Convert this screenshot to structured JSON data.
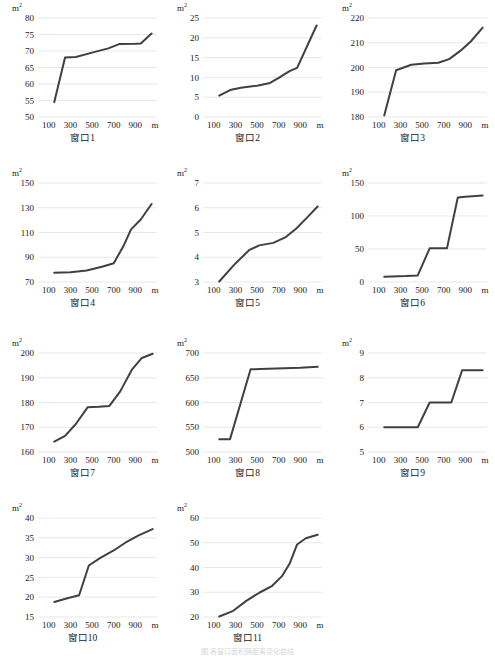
{
  "page": {
    "unit_label": "m",
    "unit_superscript": "2",
    "x_unit": "m",
    "footer_note": "图  各窗口面积随距离变化曲线"
  },
  "charts": [
    {
      "id": "chart-1",
      "caption": "窗口1",
      "chart_data": {
        "type": "line",
        "title": "窗口1",
        "xlabel": "m",
        "ylabel": "m²",
        "xlim": [
          0,
          1100
        ],
        "ylim": [
          50,
          80
        ],
        "yticks": [
          50,
          55,
          60,
          65,
          70,
          75,
          80
        ],
        "xticks": [
          100,
          300,
          500,
          700,
          900
        ],
        "grid": true,
        "legend": "none",
        "x": [
          150,
          250,
          350,
          500,
          650,
          750,
          900,
          950,
          1050
        ],
        "y": [
          54.5,
          68.0,
          68.2,
          69.5,
          70.8,
          72.1,
          72.2,
          72.3,
          75.3
        ]
      }
    },
    {
      "id": "chart-2",
      "caption": "窗口2",
      "chart_data": {
        "type": "line",
        "title": "窗口2",
        "xlabel": "m",
        "ylabel": "m²",
        "xlim": [
          0,
          1100
        ],
        "ylim": [
          0,
          25
        ],
        "yticks": [
          0,
          5,
          10,
          15,
          20,
          25
        ],
        "xticks": [
          100,
          300,
          500,
          700,
          900
        ],
        "grid": true,
        "legend": "none",
        "x": [
          150,
          250,
          350,
          500,
          620,
          700,
          800,
          870,
          1050
        ],
        "y": [
          5.4,
          6.8,
          7.4,
          7.9,
          8.6,
          9.9,
          11.6,
          12.4,
          23.1
        ]
      }
    },
    {
      "id": "chart-3",
      "caption": "窗口3",
      "chart_data": {
        "type": "line",
        "title": "窗口3",
        "xlabel": "m",
        "ylabel": "m²",
        "xlim": [
          0,
          1100
        ],
        "ylim": [
          180,
          220
        ],
        "yticks": [
          180,
          190,
          200,
          210,
          220
        ],
        "xticks": [
          100,
          300,
          500,
          700,
          900
        ],
        "grid": true,
        "legend": "none",
        "x": [
          150,
          260,
          400,
          520,
          650,
          750,
          850,
          950,
          1060
        ],
        "y": [
          180.6,
          198.9,
          201.1,
          201.6,
          201.9,
          203.4,
          206.6,
          210.5,
          216.1
        ]
      }
    },
    {
      "id": "chart-4",
      "caption": "窗口4",
      "chart_data": {
        "type": "line",
        "title": "窗口4",
        "xlabel": "m",
        "ylabel": "m²",
        "xlim": [
          0,
          1100
        ],
        "ylim": [
          70,
          150
        ],
        "yticks": [
          70,
          90,
          110,
          130,
          150
        ],
        "xticks": [
          100,
          300,
          500,
          700,
          900
        ],
        "grid": true,
        "legend": "none",
        "x": [
          150,
          300,
          450,
          600,
          700,
          790,
          860,
          950,
          1050
        ],
        "y": [
          77.5,
          77.8,
          79.3,
          82.5,
          85.2,
          99.0,
          112.5,
          120.5,
          133.0
        ]
      }
    },
    {
      "id": "chart-5",
      "caption": "窗口5",
      "chart_data": {
        "type": "line",
        "title": "窗口5",
        "xlabel": "m",
        "ylabel": "m²",
        "xlim": [
          0,
          1100
        ],
        "ylim": [
          3,
          7
        ],
        "yticks": [
          3,
          4,
          5,
          6,
          7
        ],
        "xticks": [
          100,
          300,
          500,
          700,
          900
        ],
        "grid": true,
        "legend": "none",
        "x": [
          150,
          300,
          430,
          520,
          650,
          760,
          860,
          950,
          1060
        ],
        "y": [
          3.02,
          3.75,
          4.3,
          4.48,
          4.58,
          4.8,
          5.15,
          5.55,
          6.05
        ]
      }
    },
    {
      "id": "chart-6",
      "caption": "窗口6",
      "chart_data": {
        "type": "line",
        "title": "窗口6",
        "xlabel": "m",
        "ylabel": "m²",
        "xlim": [
          0,
          1100
        ],
        "ylim": [
          0,
          150
        ],
        "yticks": [
          0,
          50,
          100,
          150
        ],
        "xticks": [
          100,
          300,
          500,
          700,
          900
        ],
        "grid": true,
        "legend": "none",
        "x": [
          150,
          350,
          460,
          570,
          730,
          830,
          900,
          1060
        ],
        "y": [
          8,
          9,
          10,
          51,
          51,
          128,
          129,
          131
        ]
      }
    },
    {
      "id": "chart-7",
      "caption": "窗口7",
      "chart_data": {
        "type": "line",
        "title": "窗口7",
        "xlabel": "m",
        "ylabel": "m²",
        "xlim": [
          0,
          1100
        ],
        "ylim": [
          160,
          200
        ],
        "yticks": [
          160,
          170,
          180,
          190,
          200
        ],
        "xticks": [
          100,
          300,
          500,
          700,
          900
        ],
        "grid": true,
        "legend": "none",
        "x": [
          150,
          250,
          350,
          460,
          560,
          660,
          760,
          870,
          960,
          1060
        ],
        "y": [
          164.2,
          166.5,
          171.3,
          178.1,
          178.3,
          178.6,
          184.5,
          193.4,
          198.0,
          199.7
        ]
      }
    },
    {
      "id": "chart-8",
      "caption": "窗口8",
      "chart_data": {
        "type": "line",
        "title": "窗口8",
        "xlabel": "m",
        "ylabel": "m²",
        "xlim": [
          0,
          1100
        ],
        "ylim": [
          500,
          700
        ],
        "yticks": [
          500,
          550,
          600,
          650,
          700
        ],
        "xticks": [
          100,
          300,
          500,
          700,
          900
        ],
        "grid": true,
        "legend": "none",
        "x": [
          150,
          250,
          440,
          600,
          750,
          900,
          1060
        ],
        "y": [
          526,
          526,
          667,
          668,
          669,
          670,
          672
        ]
      }
    },
    {
      "id": "chart-9",
      "caption": "窗口9",
      "chart_data": {
        "type": "line",
        "title": "窗口9",
        "xlabel": "m",
        "ylabel": "m²",
        "xlim": [
          0,
          1100
        ],
        "ylim": [
          5,
          9
        ],
        "yticks": [
          5,
          6,
          7,
          8,
          9
        ],
        "xticks": [
          100,
          300,
          500,
          700,
          900
        ],
        "grid": true,
        "legend": "none",
        "x": [
          150,
          350,
          460,
          570,
          700,
          770,
          870,
          960,
          1060
        ],
        "y": [
          6.0,
          6.0,
          6.0,
          7.0,
          7.0,
          7.0,
          8.3,
          8.3,
          8.3
        ]
      }
    },
    {
      "id": "chart-10",
      "caption": "窗口10",
      "chart_data": {
        "type": "line",
        "title": "窗口10",
        "xlabel": "m",
        "ylabel": "m²",
        "xlim": [
          0,
          1100
        ],
        "ylim": [
          15,
          40
        ],
        "yticks": [
          15,
          20,
          25,
          30,
          35,
          40
        ],
        "xticks": [
          100,
          300,
          500,
          700,
          900
        ],
        "grid": true,
        "legend": "none",
        "x": [
          150,
          280,
          380,
          470,
          580,
          700,
          820,
          930,
          1060
        ],
        "y": [
          18.8,
          19.8,
          20.5,
          28.0,
          30.0,
          31.8,
          34.0,
          35.6,
          37.2
        ]
      }
    },
    {
      "id": "chart-11",
      "caption": "窗口11",
      "chart_data": {
        "type": "line",
        "title": "窗口11",
        "xlabel": "m",
        "ylabel": "m²",
        "xlim": [
          0,
          1100
        ],
        "ylim": [
          20,
          60
        ],
        "yticks": [
          20,
          30,
          40,
          50,
          60
        ],
        "xticks": [
          100,
          300,
          500,
          700,
          900
        ],
        "grid": true,
        "legend": "none",
        "x": [
          150,
          280,
          400,
          520,
          640,
          730,
          800,
          870,
          950,
          1060
        ],
        "y": [
          20.2,
          22.5,
          26.5,
          29.8,
          32.6,
          36.5,
          41.5,
          49.3,
          51.8,
          53.2
        ]
      }
    }
  ]
}
